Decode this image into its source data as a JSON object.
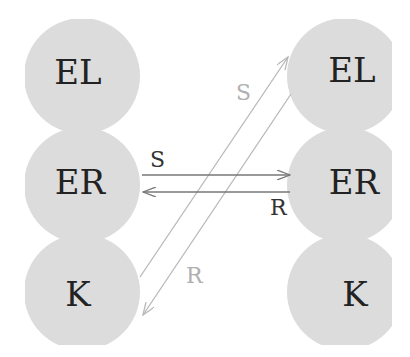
{
  "diagram": {
    "colors": {
      "node_fill": "#dcdcdc",
      "node_text": "#222222",
      "arrow_dark": "#777777",
      "arrow_light": "#b8b8b8",
      "label_dark": "#333333",
      "label_light": "#b0b0b0"
    },
    "left_column": {
      "nodes": [
        {
          "label": "EL"
        },
        {
          "label": "ER"
        },
        {
          "label": "K"
        }
      ]
    },
    "right_column": {
      "nodes": [
        {
          "label": "EL"
        },
        {
          "label": "ER"
        },
        {
          "label": "K"
        }
      ]
    },
    "arrows": [
      {
        "label": "S",
        "from": "left.ER",
        "to": "right.ER",
        "style": "dark"
      },
      {
        "label": "R",
        "from": "right.ER",
        "to": "left.ER",
        "style": "dark"
      },
      {
        "label": "S",
        "from": "left.K",
        "to": "right.EL",
        "style": "light"
      },
      {
        "label": "R",
        "from": "right.EL",
        "to": "left.K",
        "style": "light"
      }
    ]
  }
}
